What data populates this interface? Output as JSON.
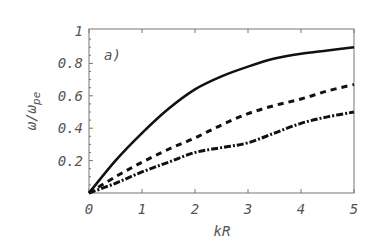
{
  "chart_data": {
    "type": "line",
    "title": "",
    "panel_label": "a)",
    "xlabel": "kR",
    "ylabel": "ω/ω_pe",
    "ylabel_main": "ω/ω",
    "ylabel_sub": "pe",
    "xlim": [
      0,
      5
    ],
    "ylim": [
      0,
      1
    ],
    "grid": false,
    "legend": null,
    "x_ticks": [
      "0",
      "1",
      "2",
      "3",
      "4",
      "5"
    ],
    "y_ticks": [
      "0.2",
      "0.4",
      "0.6",
      "0.8",
      "1"
    ],
    "x": [
      0,
      0.5,
      1,
      1.5,
      2,
      2.5,
      3,
      3.5,
      4,
      4.5,
      5
    ],
    "series": [
      {
        "name": "solid",
        "style": "solid",
        "values": [
          0,
          0.2,
          0.37,
          0.52,
          0.64,
          0.72,
          0.78,
          0.83,
          0.86,
          0.88,
          0.9
        ]
      },
      {
        "name": "dashed",
        "style": "dashed",
        "values": [
          0,
          0.1,
          0.19,
          0.27,
          0.34,
          0.42,
          0.49,
          0.54,
          0.58,
          0.63,
          0.67
        ]
      },
      {
        "name": "dash-dot",
        "style": "dash-dot",
        "values": [
          0,
          0.06,
          0.13,
          0.19,
          0.25,
          0.28,
          0.31,
          0.37,
          0.43,
          0.47,
          0.5
        ]
      }
    ],
    "colors": {
      "line": "#111111",
      "axis": "#777777",
      "text": "#555555"
    }
  }
}
